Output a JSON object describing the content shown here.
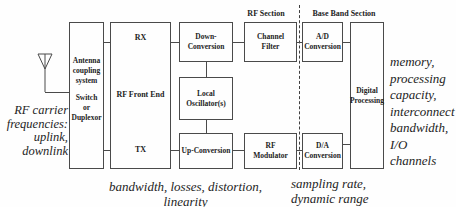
{
  "sections": {
    "rf": "RF Section",
    "baseband": "Base Band Section"
  },
  "blocks": {
    "antenna_coupling_top": "Antenna\ncoupling\nsystem",
    "antenna_coupling_bottom": "Switch\nor\nDuplexor",
    "rx": "RX",
    "rf_front_end": "RF Front End",
    "tx": "TX",
    "down_conversion": "Down-\nConversion",
    "local_oscillator": "Local\nOscillator(s)",
    "up_conversion": "Up-Conversion",
    "channel_filter": "Channel\nFilter",
    "rf_modulator": "RF\nModulator",
    "ad_conversion": "A/D\nConversion",
    "da_conversion": "D/A\nConversion",
    "digital_processing": "Digital\nProcessing"
  },
  "annotations": {
    "rf_carrier": "RF carrier\nfrequencies:\nuplink,\ndownlink",
    "analog_constraints": "bandwidth, losses, distortion, linearity",
    "converter_constraints": "sampling rate,\ndynamic range",
    "digital_constraints": "memory,\nprocessing\ncapacity,\ninterconnect\nbandwidth,\nI/O channels"
  },
  "colors": {
    "line": "#4a4a4a",
    "text": "#1d1d1d",
    "background": "#fefefe"
  }
}
